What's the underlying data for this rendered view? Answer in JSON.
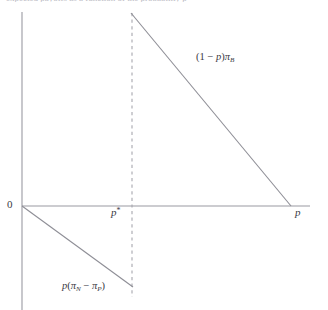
{
  "figure": {
    "title_bleed": "expected payoffs as a function of the probability p",
    "background_color": "#ffffff",
    "axis_color": "#9a9aa2",
    "curve_color": "#8e8e96",
    "dashed_color": "#a6a6ae",
    "text_color": "#3a3a44"
  },
  "labels": {
    "origin": "0",
    "p_star_base": "p",
    "p_star_sup": "*",
    "p_axis": "p"
  },
  "expressions": {
    "upper": {
      "open_paren": "(",
      "one": "1",
      "minus": " − ",
      "p": "p",
      "close_paren": ")",
      "pi": "π",
      "pi_sub": "B"
    },
    "lower": {
      "p": "p",
      "open_paren": "(",
      "pi1": "π",
      "pi1_sub": "N",
      "minus": " − ",
      "pi2": "π",
      "pi2_sub": "P",
      "close_paren": ")"
    }
  },
  "chart_data": {
    "type": "line",
    "title": "",
    "xlabel": "p",
    "ylabel": "",
    "xlim": [
      0,
      1
    ],
    "ylim": [
      -0.45,
      1.0
    ],
    "grid": false,
    "legend": "none",
    "axes": {
      "vertical_axis_x_px": 22,
      "vertical_axis_top_px": 12,
      "vertical_axis_bottom_px": 310,
      "horizontal_axis_y_px": 206,
      "horizontal_axis_left_px": 22,
      "horizontal_axis_right_px": 310
    },
    "annotations": [
      {
        "text": "0",
        "x_px": 12,
        "y_px": 205
      },
      {
        "text": "p*",
        "x_px": 115,
        "y_px": 213
      },
      {
        "text": "p",
        "x_px": 298,
        "y_px": 213
      },
      {
        "text": "(1 - p)π_B",
        "x_px": 220,
        "y_px": 59
      },
      {
        "text": "p(π_N - π_P)",
        "x_px": 96,
        "y_px": 287
      }
    ],
    "series": [
      {
        "name": "(1 - p)π_B",
        "type": "line",
        "points_px": [
          [
            131,
            13
          ],
          [
            291,
            206
          ]
        ],
        "points_data": [
          [
            0.38,
            0.62
          ],
          [
            1.0,
            0.0
          ]
        ],
        "color": "#8e8e96",
        "style": "solid",
        "label": "(1 - p)π_B"
      },
      {
        "name": "p(π_N - π_P)",
        "type": "line",
        "points_px": [
          [
            22,
            206
          ],
          [
            133,
            287
          ]
        ],
        "points_data": [
          [
            0.0,
            0.0
          ],
          [
            0.38,
            -0.26
          ]
        ],
        "color": "#8e8e96",
        "style": "solid",
        "label": "p(π_N - π_P)"
      },
      {
        "name": "p* reference line",
        "type": "line",
        "points_px": [
          [
            132,
            13
          ],
          [
            132,
            297
          ]
        ],
        "points_data": [
          [
            0.38,
            0.62
          ],
          [
            0.38,
            -0.31
          ]
        ],
        "color": "#a6a6ae",
        "style": "dashed",
        "label": "p*"
      }
    ]
  }
}
